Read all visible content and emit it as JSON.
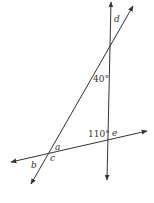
{
  "diagram": {
    "colors": {
      "line": "#333333",
      "background": "#ffffff"
    },
    "lines": [
      {
        "id": "vertical-line",
        "x1": 107,
        "y1": 180,
        "x2": 111,
        "y2": 2
      },
      {
        "id": "diagonal-line",
        "x1": 31,
        "y1": 184,
        "x2": 133,
        "y2": 5
      },
      {
        "id": "transversal-line",
        "x1": 11,
        "y1": 162,
        "x2": 147,
        "y2": 131
      }
    ],
    "labels": {
      "d": "d",
      "angle40": "40°",
      "angle110": "110°",
      "e": "e",
      "a": "a",
      "b": "b",
      "c": "c"
    }
  }
}
